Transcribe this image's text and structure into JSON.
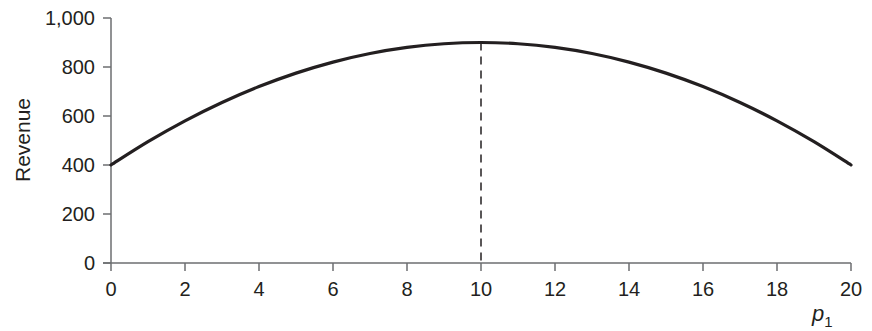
{
  "chart_data": {
    "type": "line",
    "title": "",
    "xlabel": "p",
    "xlabel_subscript": "1",
    "ylabel": "Revenue",
    "xlim": [
      0,
      20
    ],
    "ylim": [
      0,
      1000
    ],
    "x_ticks": [
      0,
      2,
      4,
      6,
      8,
      10,
      12,
      14,
      16,
      18,
      20
    ],
    "x_tick_labels": [
      "0",
      "2",
      "4",
      "6",
      "8",
      "10",
      "12",
      "14",
      "16",
      "18",
      "20"
    ],
    "y_ticks": [
      0,
      200,
      400,
      600,
      800,
      1000
    ],
    "y_tick_labels": [
      "0",
      "200",
      "400",
      "600",
      "800",
      "1,000"
    ],
    "grid": false,
    "legend": null,
    "series": [
      {
        "name": "Revenue",
        "x": [
          0,
          1,
          2,
          3,
          4,
          5,
          6,
          7,
          8,
          9,
          10,
          11,
          12,
          13,
          14,
          15,
          16,
          17,
          18,
          19,
          20
        ],
        "values": [
          400,
          495,
          580,
          655,
          720,
          775,
          820,
          855,
          880,
          895,
          900,
          895,
          880,
          855,
          820,
          775,
          720,
          655,
          580,
          495,
          400
        ]
      }
    ],
    "annotations": [
      {
        "type": "vertical-dashed-line",
        "x": 10,
        "from_y": 0,
        "to_y": 900,
        "label": "maximum revenue"
      }
    ]
  },
  "colors": {
    "curve": "#231f20",
    "axis": "#6d6e71",
    "text": "#231f20"
  }
}
